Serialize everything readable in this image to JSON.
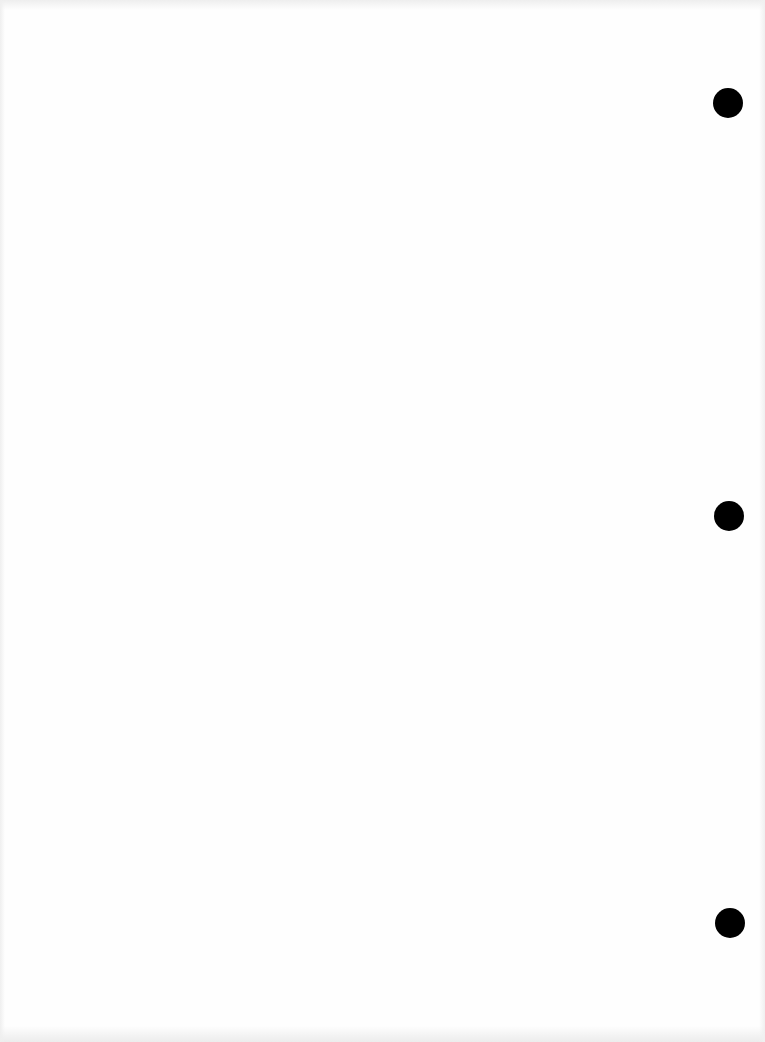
{
  "page": {
    "type": "blank scanned sheet",
    "background_color": "#fefefe",
    "text": ""
  },
  "punch_holes": [
    {
      "name": "top",
      "cx": 728,
      "cy": 103,
      "radius": 15,
      "color": "#000000"
    },
    {
      "name": "middle",
      "cx": 729,
      "cy": 516,
      "radius": 15,
      "color": "#000000"
    },
    {
      "name": "bottom",
      "cx": 730,
      "cy": 923,
      "radius": 15,
      "color": "#000000"
    }
  ]
}
